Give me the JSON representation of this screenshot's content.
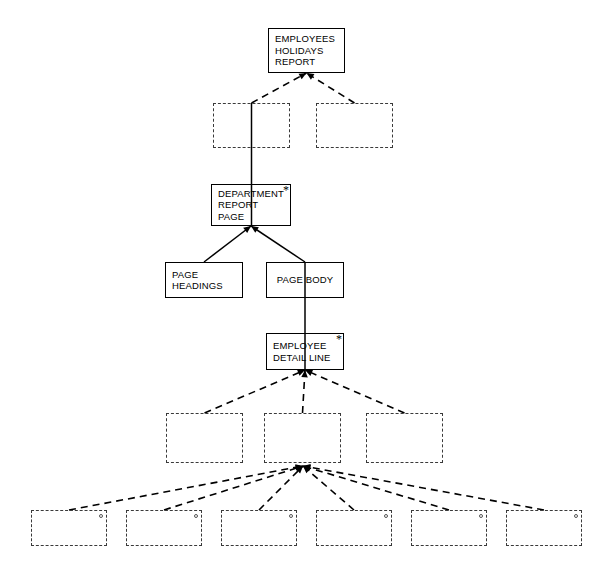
{
  "diagram": {
    "canvas": {
      "width": 611,
      "height": 579
    },
    "colors": {
      "solid_border": "#000000",
      "dashed_border": "#3a3a3a",
      "edge": "#000000",
      "background": "#ffffff"
    },
    "nodes": [
      {
        "id": "employees-holidays-report",
        "style": "solid",
        "lines": [
          "EMPLOYEES",
          "HOLIDAYS",
          "REPORT"
        ],
        "marker": "",
        "x": 268,
        "y": 28,
        "w": 77,
        "h": 45
      },
      {
        "id": "row2-left-blank",
        "style": "dashed",
        "lines": [],
        "marker": "",
        "x": 213,
        "y": 103,
        "w": 77,
        "h": 45
      },
      {
        "id": "row2-right-blank",
        "style": "dashed",
        "lines": [],
        "marker": "",
        "x": 316,
        "y": 103,
        "w": 77,
        "h": 45
      },
      {
        "id": "department-report-page",
        "style": "solid",
        "lines": [
          "DEPARTMENT",
          "REPORT",
          "PAGE"
        ],
        "marker": "*",
        "x": 211,
        "y": 184,
        "w": 80,
        "h": 42
      },
      {
        "id": "page-headings",
        "style": "solid",
        "lines": [
          "PAGE",
          "HEADINGS"
        ],
        "marker": "",
        "x": 165,
        "y": 262,
        "w": 78,
        "h": 36
      },
      {
        "id": "page-body",
        "style": "solid",
        "lines": [
          "PAGE BODY"
        ],
        "marker": "",
        "x": 266,
        "y": 262,
        "w": 78,
        "h": 36
      },
      {
        "id": "employee-detail-line",
        "style": "solid",
        "lines": [
          "EMPLOYEE",
          "DETAIL LINE"
        ],
        "marker": "*",
        "x": 266,
        "y": 333,
        "w": 78,
        "h": 37
      },
      {
        "id": "row4-left-blank",
        "style": "dashed",
        "lines": [],
        "marker": "",
        "x": 166,
        "y": 413,
        "w": 77,
        "h": 50
      },
      {
        "id": "row4-middle-blank",
        "style": "dashed",
        "lines": [],
        "marker": "",
        "x": 264,
        "y": 413,
        "w": 77,
        "h": 50
      },
      {
        "id": "row4-right-blank",
        "style": "dashed",
        "lines": [],
        "marker": "",
        "x": 366,
        "y": 413,
        "w": 77,
        "h": 50
      },
      {
        "id": "row5-blank-1",
        "style": "dashed",
        "lines": [],
        "marker": "circle",
        "x": 31,
        "y": 510,
        "w": 76,
        "h": 36
      },
      {
        "id": "row5-blank-2",
        "style": "dashed",
        "lines": [],
        "marker": "circle",
        "x": 126,
        "y": 510,
        "w": 76,
        "h": 36
      },
      {
        "id": "row5-blank-3",
        "style": "dashed",
        "lines": [],
        "marker": "circle",
        "x": 221,
        "y": 510,
        "w": 76,
        "h": 36
      },
      {
        "id": "row5-blank-4",
        "style": "dashed",
        "lines": [],
        "marker": "circle",
        "x": 316,
        "y": 510,
        "w": 76,
        "h": 36
      },
      {
        "id": "row5-blank-5",
        "style": "dashed",
        "lines": [],
        "marker": "circle",
        "x": 411,
        "y": 510,
        "w": 76,
        "h": 36
      },
      {
        "id": "row5-blank-6",
        "style": "dashed",
        "lines": [],
        "marker": "circle",
        "x": 506,
        "y": 510,
        "w": 76,
        "h": 36
      }
    ],
    "edges": [
      {
        "id": "edge-row2left-to-root",
        "from": "row2-left-blank",
        "to": "employees-holidays-report",
        "style": "dashed",
        "arrow": true
      },
      {
        "id": "edge-row2right-to-root",
        "from": "row2-right-blank",
        "to": "employees-holidays-report",
        "style": "dashed",
        "arrow": true
      },
      {
        "id": "edge-row2left-to-department",
        "from": "row2-left-blank",
        "to": "department-report-page",
        "style": "solid",
        "arrow": false
      },
      {
        "id": "edge-pageheadings-to-department",
        "from": "page-headings",
        "to": "department-report-page",
        "style": "solid",
        "arrow": true
      },
      {
        "id": "edge-pagebody-to-department",
        "from": "page-body",
        "to": "department-report-page",
        "style": "solid",
        "arrow": true
      },
      {
        "id": "edge-pagebody-to-detailline",
        "from": "page-body",
        "to": "employee-detail-line",
        "style": "solid",
        "arrow": false
      },
      {
        "id": "edge-row4left-to-detailline",
        "from": "row4-left-blank",
        "to": "employee-detail-line",
        "style": "dashed",
        "arrow": true
      },
      {
        "id": "edge-row4middle-to-detailline",
        "from": "row4-middle-blank",
        "to": "employee-detail-line",
        "style": "dashed",
        "arrow": true
      },
      {
        "id": "edge-row4right-to-detailline",
        "from": "row4-right-blank",
        "to": "employee-detail-line",
        "style": "dashed",
        "arrow": true
      },
      {
        "id": "edge-row5-1-to-hub",
        "from": "row5-blank-1",
        "to": "fan-hub",
        "style": "dashed",
        "arrow": true
      },
      {
        "id": "edge-row5-2-to-hub",
        "from": "row5-blank-2",
        "to": "fan-hub",
        "style": "dashed",
        "arrow": true
      },
      {
        "id": "edge-row5-3-to-hub",
        "from": "row5-blank-3",
        "to": "fan-hub",
        "style": "dashed",
        "arrow": true
      },
      {
        "id": "edge-row5-4-to-hub",
        "from": "row5-blank-4",
        "to": "fan-hub",
        "style": "dashed",
        "arrow": true
      },
      {
        "id": "edge-row5-5-to-hub",
        "from": "row5-blank-5",
        "to": "fan-hub",
        "style": "dashed",
        "arrow": true
      },
      {
        "id": "edge-row5-6-to-hub",
        "from": "row5-blank-6",
        "to": "fan-hub",
        "style": "dashed",
        "arrow": true
      }
    ],
    "fan_hub": {
      "x": 303,
      "y": 466
    }
  }
}
